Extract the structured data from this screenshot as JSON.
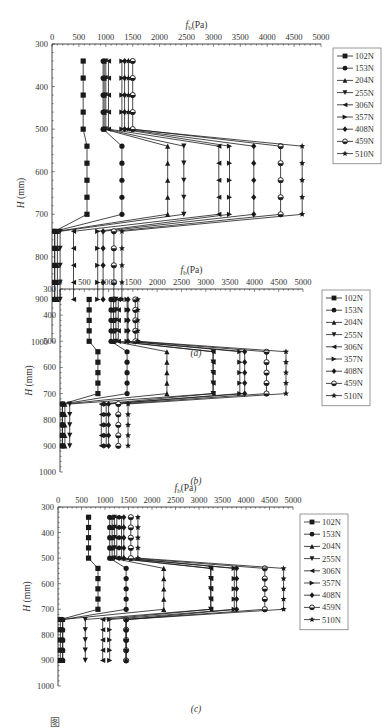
{
  "figure": {
    "caption_partial": "图",
    "panels": [
      "(a)",
      "(b)",
      "(c)"
    ]
  },
  "chart_data": [
    {
      "type": "line",
      "panel": "(a)",
      "title": "",
      "xlabel": "f_b(Pa)",
      "ylabel": "H (mm)",
      "x_ticks": [
        0,
        500,
        1000,
        1500,
        2000,
        2500,
        3000,
        3500,
        4000,
        4500,
        5000
      ],
      "y_ticks": [
        300,
        400,
        500,
        600,
        700,
        800,
        900,
        1000
      ],
      "xlim": [
        0,
        5000
      ],
      "ylim": [
        300,
        1000
      ],
      "y_inverted": true,
      "x_axis_position": "top",
      "legend_position": "right",
      "grid": false,
      "y": [
        340,
        380,
        420,
        460,
        500,
        540,
        580,
        620,
        660,
        700,
        740,
        780,
        820,
        860,
        900
      ],
      "series": [
        {
          "name": "102N",
          "marker": "square",
          "values": [
            580,
            580,
            580,
            580,
            580,
            650,
            650,
            650,
            650,
            650,
            50,
            50,
            50,
            50,
            50
          ]
        },
        {
          "name": "153N",
          "marker": "circle",
          "values": [
            950,
            950,
            950,
            950,
            950,
            1300,
            1300,
            1300,
            1300,
            1300,
            50,
            50,
            50,
            50,
            50
          ]
        },
        {
          "name": "204N",
          "marker": "triangle-up",
          "values": [
            970,
            970,
            970,
            970,
            970,
            2150,
            2150,
            2150,
            2150,
            2150,
            100,
            100,
            100,
            100,
            100
          ]
        },
        {
          "name": "255N",
          "marker": "triangle-down",
          "values": [
            1000,
            1000,
            1000,
            1000,
            1000,
            2450,
            2450,
            2450,
            2450,
            2450,
            150,
            150,
            150,
            150,
            150
          ]
        },
        {
          "name": "306N",
          "marker": "triangle-left",
          "values": [
            1050,
            1050,
            1050,
            1050,
            1050,
            3100,
            3100,
            3100,
            3100,
            3100,
            400,
            400,
            400,
            400,
            400
          ]
        },
        {
          "name": "357N",
          "marker": "triangle-right",
          "values": [
            1300,
            1300,
            1300,
            1300,
            1300,
            3300,
            3300,
            3300,
            3300,
            3300,
            850,
            850,
            850,
            850,
            850
          ]
        },
        {
          "name": "408N",
          "marker": "diamond",
          "values": [
            1350,
            1350,
            1350,
            1350,
            1350,
            3750,
            3750,
            3750,
            3750,
            3750,
            950,
            950,
            950,
            950,
            950
          ]
        },
        {
          "name": "459N",
          "marker": "half-circle",
          "values": [
            1500,
            1500,
            1500,
            1500,
            1500,
            4250,
            4250,
            4250,
            4250,
            4250,
            1150,
            1150,
            1150,
            1150,
            1150
          ]
        },
        {
          "name": "510N",
          "marker": "star",
          "values": [
            1420,
            1420,
            1420,
            1420,
            1420,
            4650,
            4650,
            4650,
            4650,
            4650,
            1300,
            1300,
            1300,
            1300,
            1300
          ]
        }
      ]
    },
    {
      "type": "line",
      "panel": "(b)",
      "title": "",
      "xlabel": "f_b(Pa)",
      "ylabel": "H (mm)",
      "x_ticks": [
        0,
        500,
        1000,
        1500,
        2000,
        2500,
        3000,
        3500,
        4000,
        4500,
        5000
      ],
      "y_ticks": [
        300,
        400,
        500,
        600,
        700,
        800,
        900,
        1000
      ],
      "xlim": [
        0,
        5000
      ],
      "ylim": [
        300,
        1000
      ],
      "y_inverted": true,
      "x_axis_position": "top",
      "legend_position": "right",
      "grid": false,
      "y": [
        340,
        380,
        420,
        460,
        500,
        540,
        580,
        620,
        660,
        700,
        740,
        780,
        820,
        860,
        900
      ],
      "series": [
        {
          "name": "102N",
          "marker": "square",
          "values": [
            600,
            600,
            600,
            600,
            600,
            780,
            780,
            780,
            780,
            780,
            50,
            50,
            50,
            50,
            50
          ]
        },
        {
          "name": "153N",
          "marker": "circle",
          "values": [
            1050,
            1050,
            1050,
            1050,
            1050,
            1380,
            1380,
            1380,
            1380,
            1380,
            50,
            50,
            50,
            50,
            50
          ]
        },
        {
          "name": "204N",
          "marker": "triangle-up",
          "values": [
            1100,
            1100,
            1100,
            1100,
            1100,
            2200,
            2200,
            2200,
            2200,
            2200,
            100,
            100,
            100,
            100,
            100
          ]
        },
        {
          "name": "255N",
          "marker": "triangle-down",
          "values": [
            1150,
            1150,
            1150,
            1150,
            1150,
            3150,
            3150,
            3150,
            3150,
            3150,
            200,
            200,
            200,
            200,
            200
          ]
        },
        {
          "name": "306N",
          "marker": "triangle-left",
          "values": [
            1200,
            1200,
            1200,
            1200,
            1200,
            3150,
            3150,
            3150,
            3150,
            3150,
            850,
            850,
            850,
            850,
            850
          ]
        },
        {
          "name": "357N",
          "marker": "triangle-right",
          "values": [
            1380,
            1380,
            1380,
            1380,
            1380,
            3700,
            3700,
            3700,
            3700,
            3700,
            950,
            950,
            950,
            950,
            950
          ]
        },
        {
          "name": "408N",
          "marker": "diamond",
          "values": [
            1400,
            1400,
            1400,
            1400,
            1400,
            3800,
            3800,
            3800,
            3800,
            3800,
            1000,
            1000,
            1000,
            1000,
            1000
          ]
        },
        {
          "name": "459N",
          "marker": "half-circle",
          "values": [
            1550,
            1550,
            1550,
            1550,
            1550,
            4250,
            4250,
            4250,
            4250,
            4250,
            1200,
            1200,
            1200,
            1200,
            1200
          ]
        },
        {
          "name": "510N",
          "marker": "star",
          "values": [
            1600,
            1600,
            1600,
            1600,
            1600,
            4650,
            4650,
            4650,
            4650,
            4650,
            1400,
            1400,
            1400,
            1400,
            1400
          ]
        }
      ]
    },
    {
      "type": "line",
      "panel": "(c)",
      "title": "",
      "xlabel": "f_b(Pa)",
      "ylabel": "H (mm)",
      "x_ticks": [
        0,
        500,
        1000,
        1500,
        2000,
        2500,
        3000,
        3500,
        4000,
        4500,
        5000
      ],
      "y_ticks": [
        300,
        400,
        500,
        600,
        700,
        800,
        900,
        1000
      ],
      "xlim": [
        0,
        5000
      ],
      "ylim": [
        300,
        1000
      ],
      "y_inverted": true,
      "x_axis_position": "top",
      "legend_position": "right",
      "grid": false,
      "y": [
        340,
        380,
        420,
        460,
        500,
        540,
        580,
        620,
        660,
        700,
        740,
        780,
        820,
        860,
        900
      ],
      "series": [
        {
          "name": "102N",
          "marker": "square",
          "values": [
            650,
            650,
            650,
            650,
            650,
            850,
            850,
            850,
            850,
            850,
            50,
            50,
            50,
            50,
            50
          ]
        },
        {
          "name": "153N",
          "marker": "circle",
          "values": [
            1100,
            1100,
            1100,
            1100,
            1100,
            1450,
            1450,
            1450,
            1450,
            1450,
            100,
            100,
            100,
            100,
            100
          ]
        },
        {
          "name": "204N",
          "marker": "triangle-up",
          "values": [
            1150,
            1150,
            1150,
            1150,
            1150,
            2250,
            2250,
            2250,
            2250,
            2250,
            100,
            100,
            100,
            100,
            100
          ]
        },
        {
          "name": "255N",
          "marker": "triangle-down",
          "values": [
            1200,
            1200,
            1200,
            1200,
            1200,
            3250,
            3250,
            3250,
            3250,
            3250,
            580,
            580,
            580,
            580,
            580
          ]
        },
        {
          "name": "306N",
          "marker": "triangle-left",
          "values": [
            1250,
            1250,
            1250,
            1250,
            1250,
            3250,
            3250,
            3250,
            3250,
            3250,
            950,
            950,
            950,
            950,
            950
          ]
        },
        {
          "name": "357N",
          "marker": "triangle-right",
          "values": [
            1350,
            1350,
            1350,
            1350,
            1350,
            3750,
            3750,
            3750,
            3750,
            3750,
            1100,
            1100,
            1100,
            1100,
            1100
          ]
        },
        {
          "name": "408N",
          "marker": "diamond",
          "values": [
            1400,
            1400,
            1400,
            1400,
            1400,
            3800,
            3800,
            3800,
            3800,
            3800,
            1450,
            1450,
            1450,
            1450,
            1450
          ]
        },
        {
          "name": "459N",
          "marker": "half-circle",
          "values": [
            1550,
            1550,
            1550,
            1550,
            1550,
            4400,
            4400,
            4400,
            4400,
            4400,
            1450,
            1450,
            1450,
            1450,
            1450
          ]
        },
        {
          "name": "510N",
          "marker": "star",
          "values": [
            1700,
            1700,
            1700,
            1700,
            1700,
            4800,
            4800,
            4800,
            4800,
            4800,
            1450,
            1450,
            1450,
            1450,
            1450
          ]
        }
      ]
    }
  ],
  "layout": {
    "panels": [
      {
        "top": 0,
        "plot": {
          "x0": 52,
          "x5000": 321,
          "y300": 44,
          "y1000": 342
        },
        "legend": {
          "x": 333,
          "y": 48
        },
        "caption_y": 356
      },
      {
        "top": 0,
        "plot": {
          "x0": 60,
          "x5000": 303,
          "y300": 289,
          "y1000": 472
        },
        "legend": {
          "x": 322,
          "y": 290
        },
        "caption_y": 484
      },
      {
        "top": 0,
        "plot": {
          "x0": 58,
          "x5000": 293,
          "y300": 507,
          "y1000": 686
        },
        "legend": {
          "x": 300,
          "y": 514
        },
        "caption_y": 712
      }
    ],
    "color": "#1a1a1a"
  }
}
